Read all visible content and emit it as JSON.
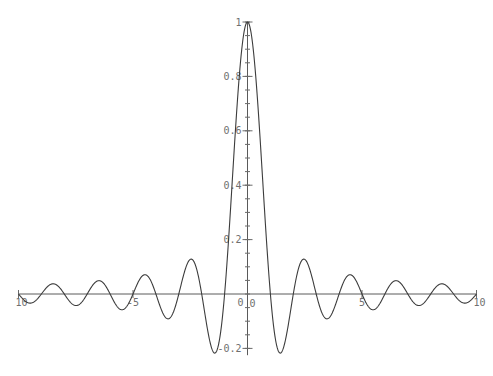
{
  "chart_data": {
    "type": "line",
    "title": "",
    "xlabel": "",
    "ylabel": "",
    "function": "sin(pi*x)/(pi*x)",
    "xlim": [
      -10,
      10
    ],
    "ylim": [
      -0.225,
      1
    ],
    "grid": false,
    "legend": null,
    "x_ticks": [
      {
        "value": -10,
        "label": "10"
      },
      {
        "value": -5,
        "label": "-5"
      },
      {
        "value": 0,
        "label": "0"
      },
      {
        "value": 5,
        "label": "5"
      },
      {
        "value": 10,
        "label": "10"
      }
    ],
    "y_ticks": [
      {
        "value": -0.2,
        "label": "-0.2"
      },
      {
        "value": 0,
        "label": "0"
      },
      {
        "value": 0.2,
        "label": "0.2"
      },
      {
        "value": 0.4,
        "label": "0.4"
      },
      {
        "value": 0.6,
        "label": "0.6"
      },
      {
        "value": 0.8,
        "label": "0.8"
      },
      {
        "value": 1,
        "label": "1"
      }
    ],
    "y_minor_tick_step": 0.05,
    "series": [
      {
        "name": "sinc",
        "color": "#3c3c3c",
        "x": [
          -10,
          -9.5,
          -8.5,
          -7.5,
          -6.5,
          -5.5,
          -4.5,
          -3.47,
          -2.46,
          -1.43,
          -1,
          0,
          1,
          1.43,
          2.46,
          3.47,
          4.5,
          5.5,
          6.5,
          7.5,
          8.5,
          9.5,
          10
        ],
        "values": [
          0,
          -0.034,
          0.037,
          -0.042,
          0.049,
          -0.058,
          0.071,
          -0.091,
          0.128,
          -0.217,
          0,
          1,
          0,
          -0.217,
          0.128,
          -0.091,
          0.071,
          -0.058,
          0.049,
          -0.042,
          0.037,
          -0.034,
          0
        ]
      }
    ],
    "layout": {
      "x0_px": 247.5,
      "y0_px": 294,
      "x_scale_px": 22.9,
      "y_scale_px": 272
    },
    "colors": {
      "axis": "#5a5a5a",
      "curve": "#3c3c3c",
      "label": "#6f6f6f",
      "background": "#ffffff"
    }
  }
}
